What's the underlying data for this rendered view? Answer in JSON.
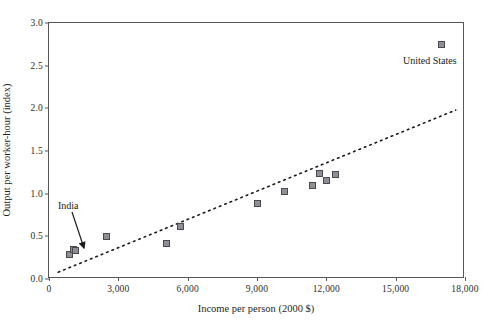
{
  "chart_data": {
    "type": "scatter",
    "title": "",
    "xlabel": "Income per person (2000 $)",
    "ylabel": "Output per worker-hour (index)",
    "xlim": [
      0,
      18000
    ],
    "ylim": [
      0.0,
      3.0
    ],
    "xticks": [
      0,
      3000,
      6000,
      9000,
      12000,
      15000,
      18000
    ],
    "xtick_labels": [
      "0",
      "3,000",
      "6,000",
      "9,000",
      "12,000",
      "15,000",
      "18,000"
    ],
    "yticks": [
      0.0,
      0.5,
      1.0,
      1.5,
      2.0,
      2.5,
      3.0
    ],
    "ytick_labels": [
      "0.0",
      "0.5",
      "1.0",
      "1.5",
      "2.0",
      "2.5",
      "3.0"
    ],
    "grid": false,
    "legend": "none",
    "marker": "square",
    "marker_fill": "#8e8e94",
    "marker_edge": "#4a4a50",
    "points": [
      {
        "x": 900,
        "y": 0.29
      },
      {
        "x": 1050,
        "y": 0.35
      },
      {
        "x": 1150,
        "y": 0.33
      },
      {
        "x": 2500,
        "y": 0.5
      },
      {
        "x": 5100,
        "y": 0.42
      },
      {
        "x": 5700,
        "y": 0.62
      },
      {
        "x": 9000,
        "y": 0.88
      },
      {
        "x": 10200,
        "y": 1.03
      },
      {
        "x": 11400,
        "y": 1.1
      },
      {
        "x": 11700,
        "y": 1.24
      },
      {
        "x": 12000,
        "y": 1.16
      },
      {
        "x": 12400,
        "y": 1.23
      },
      {
        "x": 17000,
        "y": 2.75
      }
    ],
    "trendline": {
      "style": "dotted",
      "color": "#1a1a1a",
      "x_start": 400,
      "y_start": 0.08,
      "x_end": 17600,
      "y_end": 1.98
    },
    "annotations": [
      {
        "label": "India",
        "label_x_px": 58,
        "label_y_px": 200,
        "arrow_from": [
          72,
          212
        ],
        "arrow_to": [
          84,
          248
        ]
      },
      {
        "label": "United States",
        "label_x_px": 403,
        "label_y_px": 55,
        "arrow_from": null,
        "arrow_to": null
      }
    ]
  }
}
